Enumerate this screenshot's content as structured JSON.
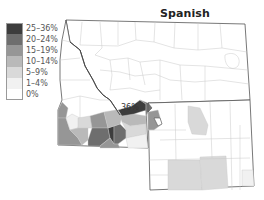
{
  "title": "Spanish",
  "legend": {
    "items": [
      {
        "label": "25–36%",
        "color": "#3d3d3d"
      },
      {
        "label": "20–24%",
        "color": "#6e6e6e"
      },
      {
        "label": "15–19%",
        "color": "#969696"
      },
      {
        "label": "10–14%",
        "color": "#b9b9b9"
      },
      {
        "label": "5–9%",
        "color": "#d9d9d9"
      },
      {
        "label": "1–4%",
        "color": "#f1f1f1"
      },
      {
        "label": "0%",
        "color": "#ffffff"
      }
    ]
  },
  "annotation": {
    "label": "36%"
  },
  "map": {
    "regions": [
      "Montana",
      "Idaho (eastern portion)",
      "Wyoming"
    ],
    "border_color": "#555555",
    "county_line_color": "#c8c8c8"
  }
}
